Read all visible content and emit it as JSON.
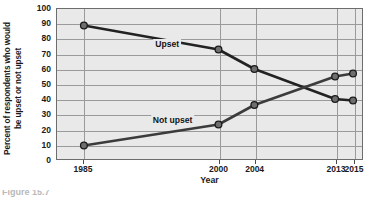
{
  "figure": {
    "caption": "Figure 15.7"
  },
  "chart_data": {
    "type": "line",
    "title": "",
    "xlabel": "Year",
    "ylabel": "Percent of respondents who would be upset or not upset",
    "ylabel_line1": "Percent of respondents who would",
    "ylabel_line2": "be upset or not upset",
    "x": [
      1985,
      2000,
      2004,
      2013,
      2015
    ],
    "categories": [
      "1985",
      "2000",
      "2004",
      "2013",
      "2015"
    ],
    "xlim": [
      1982,
      2016
    ],
    "ylim": [
      0,
      100
    ],
    "yticks": [
      0,
      10,
      20,
      30,
      40,
      50,
      60,
      70,
      80,
      90,
      100
    ],
    "ytick_labels": [
      "0",
      "10",
      "20",
      "30",
      "40",
      "50",
      "60",
      "70",
      "80",
      "90",
      "100"
    ],
    "grid": true,
    "legend_position": "inline",
    "series": [
      {
        "name": "Upset",
        "label": "Upset",
        "label_x": 1994.2,
        "label_y": 77,
        "color": "#222222",
        "values": [
          89,
          73,
          60,
          40,
          39
        ]
      },
      {
        "name": "Not upset",
        "label": "Not upset",
        "label_x": 1994.8,
        "label_y": 27,
        "color": "#3c3c3c",
        "values": [
          9,
          23,
          36,
          55,
          57
        ]
      }
    ]
  },
  "style": {
    "plot_background": "#e9e9e9",
    "grid_color": "#9a9a9a",
    "axis_color": "#6d6d6d",
    "marker_fill": "#6e6e6e",
    "marker_edge": "#1a1a1a",
    "text_color": "#1a1a1a"
  }
}
